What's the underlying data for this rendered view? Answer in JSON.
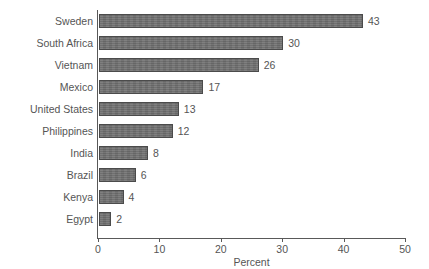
{
  "chart_data": {
    "type": "bar",
    "orientation": "horizontal",
    "title": "",
    "subtitle": "",
    "xlabel": "Percent",
    "ylabel": "",
    "xlim": [
      0,
      50
    ],
    "xticks": [
      0,
      10,
      20,
      30,
      40,
      50
    ],
    "xtick_labels": [
      "0",
      "10",
      "20",
      "30",
      "40",
      "50"
    ],
    "grid": false,
    "legend": null,
    "show_data_labels": true,
    "categories": [
      "Sweden",
      "South Africa",
      "Vietnam",
      "Mexico",
      "United States",
      "Philippines",
      "India",
      "Brazil",
      "Kenya",
      "Egypt"
    ],
    "values": [
      43,
      30,
      26,
      17,
      13,
      12,
      8,
      6,
      4,
      2
    ],
    "value_labels": [
      "43",
      "30",
      "26",
      "17",
      "13",
      "12",
      "8",
      "6",
      "4",
      "2"
    ],
    "colors": {
      "bar_fill": "#6f6f6f",
      "bar_border": "#4b4b4b",
      "axis": "#595959",
      "text": "#555555",
      "background": "#ffffff"
    }
  }
}
